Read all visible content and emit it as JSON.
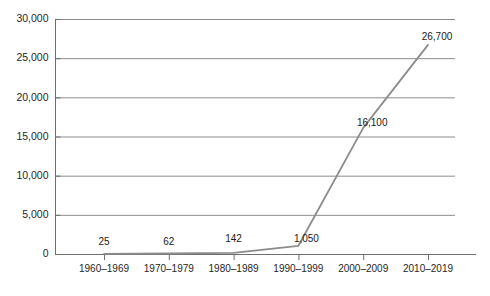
{
  "chart_data": {
    "type": "line",
    "title": "",
    "subtitle": "",
    "xlabel": "",
    "ylabel": "",
    "categories": [
      "1960–1969",
      "1970–1979",
      "1980–1989",
      "1990–1999",
      "2000–2009",
      "2010–2019"
    ],
    "values": [
      25,
      62,
      142,
      1050,
      16100,
      26700
    ],
    "point_labels": [
      "25",
      "62",
      "142",
      "1,050",
      "16,100",
      "26,700"
    ],
    "ylim": [
      0,
      30000
    ],
    "ytick_values": [
      0,
      5000,
      10000,
      15000,
      20000,
      25000,
      30000
    ],
    "ytick_labels": [
      "0",
      "5,000",
      "10,000",
      "15,000",
      "20,000",
      "25,000",
      "30,000"
    ],
    "grid": true,
    "grid_axis": "y",
    "legend": false,
    "legend_position": "none",
    "series": [
      {
        "name": "",
        "values": [
          25,
          62,
          142,
          1050,
          16100,
          26700
        ],
        "color": "#8c8c8c"
      }
    ],
    "colors": {
      "line": "#8c8c8c",
      "grid": "#8c8c8c",
      "axis": "#6e6e6e",
      "text": "#1a1a1a",
      "background": "#ffffff"
    }
  }
}
